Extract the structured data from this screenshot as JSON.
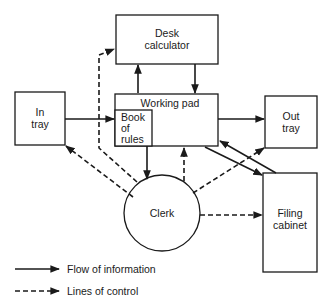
{
  "diagram": {
    "nodes": {
      "desk_calculator": {
        "line1": "Desk",
        "line2": "calculator"
      },
      "in_tray": {
        "line1": "In",
        "line2": "tray"
      },
      "working_pad": {
        "label": "Working pad"
      },
      "book_of_rules": {
        "line1": "Book",
        "line2": "of",
        "line3": "rules"
      },
      "out_tray": {
        "line1": "Out",
        "line2": "tray"
      },
      "filing_cabinet": {
        "line1": "Filing",
        "line2": "cabinet"
      },
      "clerk": {
        "label": "Clerk"
      }
    },
    "edges": [
      {
        "from": "In tray",
        "to": "Working pad",
        "type": "flow of information"
      },
      {
        "from": "Working pad",
        "to": "Desk calculator",
        "type": "flow of information"
      },
      {
        "from": "Desk calculator",
        "to": "Working pad",
        "type": "flow of information"
      },
      {
        "from": "Working pad",
        "to": "Out tray",
        "type": "flow of information"
      },
      {
        "from": "Working pad",
        "to": "Clerk",
        "type": "flow of information"
      },
      {
        "from": "Working pad",
        "to": "Filing cabinet",
        "type": "flow of information"
      },
      {
        "from": "Filing cabinet",
        "to": "Working pad",
        "type": "flow of information"
      },
      {
        "from": "Clerk",
        "to": "Desk calculator",
        "type": "lines of control"
      },
      {
        "from": "Clerk",
        "to": "In tray",
        "type": "lines of control"
      },
      {
        "from": "Clerk",
        "to": "Working pad",
        "type": "lines of control"
      },
      {
        "from": "Clerk",
        "to": "Out tray",
        "type": "lines of control"
      },
      {
        "from": "Clerk",
        "to": "Filing cabinet",
        "type": "lines of control"
      }
    ],
    "legend": {
      "solid": "Flow of information",
      "dashed": "Lines of control"
    }
  }
}
